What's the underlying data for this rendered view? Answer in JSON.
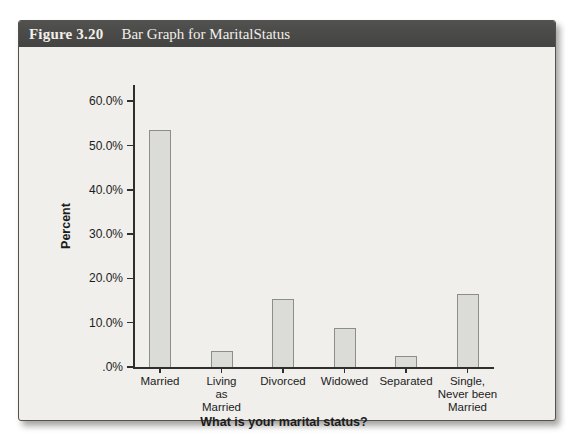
{
  "figure": {
    "label": "Figure 3.20",
    "title": "Bar Graph for MaritalStatus"
  },
  "chart_data": {
    "type": "bar",
    "title": "Bar Graph for MaritalStatus",
    "xlabel": "What is your marital status?",
    "ylabel": "Percent",
    "categories": [
      "Married",
      "Living as Married",
      "Divorced",
      "Widowed",
      "Separated",
      "Single, Never been Married"
    ],
    "category_label_lines": [
      [
        "Married"
      ],
      [
        "Living",
        "as",
        "Married"
      ],
      [
        "Divorced"
      ],
      [
        "Widowed"
      ],
      [
        "Separated"
      ],
      [
        "Single,",
        "Never been",
        "Married"
      ]
    ],
    "values": [
      53.6,
      3.5,
      15.3,
      8.9,
      2.4,
      16.4
    ],
    "ylim": [
      0,
      63
    ],
    "yticks": [
      0,
      10,
      20,
      30,
      40,
      50,
      60
    ],
    "ytick_labels": [
      ".0%",
      "10.0%",
      "20.0%",
      "30.0%",
      "40.0%",
      "50.0%",
      "60.0%"
    ],
    "grid": false,
    "legend": "none",
    "colors": {
      "bar_fill": "#dbdbd8",
      "bar_border": "#8d8d8b",
      "axis": "#2f2f2f",
      "card_background": "#f0efec",
      "header_background": "#4a4a49",
      "header_text": "#f2efe8"
    }
  }
}
